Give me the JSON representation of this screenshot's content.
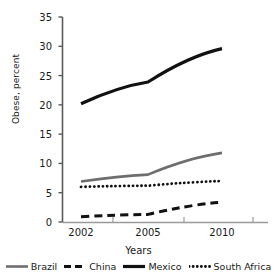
{
  "chart_data": {
    "type": "line",
    "title": "",
    "xlabel": "Years",
    "ylabel": "Obese, percent",
    "x": [
      2002,
      2005,
      2010
    ],
    "categories": [
      "2002",
      "2005",
      "2010"
    ],
    "xticklabels": [
      "2002",
      "2005",
      "2010"
    ],
    "yticklabels": [
      "0",
      "5",
      "10",
      "15",
      "20",
      "25",
      "30",
      "35"
    ],
    "yticks": [
      0,
      5,
      10,
      15,
      20,
      25,
      30,
      35
    ],
    "ylim": [
      0,
      35
    ],
    "xlim": [
      2001,
      2011
    ],
    "grid": false,
    "legend_position": "bottom",
    "series": [
      {
        "name": "Brazil",
        "values": [
          6.9,
          8.1,
          11.8
        ],
        "color": "#6e6e6e",
        "style": "solid",
        "width": 2.6
      },
      {
        "name": "China",
        "values": [
          0.9,
          1.3,
          3.4
        ],
        "color": "#111111",
        "style": "dashed",
        "width": 3.0
      },
      {
        "name": "Mexico",
        "values": [
          20.2,
          23.9,
          29.6
        ],
        "color": "#111111",
        "style": "solid",
        "width": 3.2
      },
      {
        "name": "South Africa",
        "values": [
          6.0,
          6.2,
          7.0
        ],
        "color": "#111111",
        "style": "dotted",
        "width": 2.8
      }
    ]
  },
  "axes": {
    "ylabel": "Obese, percent",
    "xlabel": "Years",
    "yticks": [
      "0",
      "5",
      "10",
      "15",
      "20",
      "25",
      "30",
      "35"
    ],
    "xticks": [
      "2002",
      "2005",
      "2010"
    ]
  },
  "legend": {
    "items": [
      {
        "label": "Brazil"
      },
      {
        "label": "China"
      },
      {
        "label": "Mexico"
      },
      {
        "label": "South Africa"
      }
    ]
  }
}
